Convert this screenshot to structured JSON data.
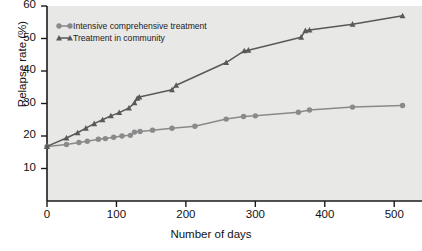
{
  "chart_data": {
    "type": "line",
    "title": "",
    "xlabel": "Number of days",
    "ylabel": "Relapse rate (%)",
    "xlim": [
      0,
      540
    ],
    "ylim": [
      0,
      60
    ],
    "xticks": [
      0,
      100,
      200,
      300,
      400,
      500
    ],
    "yticks": [
      10,
      20,
      30,
      40,
      50,
      60
    ],
    "grid": false,
    "legend_position": "top-left",
    "plot_background": "#e8e8e6",
    "series": [
      {
        "name": "Intensive comprehensive treatment",
        "marker": "circle",
        "color": "#8a8a8a",
        "points": [
          [
            0,
            16.8
          ],
          [
            28,
            17.4
          ],
          [
            46,
            18.0
          ],
          [
            58,
            18.4
          ],
          [
            74,
            19.0
          ],
          [
            84,
            19.2
          ],
          [
            96,
            19.6
          ],
          [
            108,
            20.0
          ],
          [
            120,
            20.2
          ],
          [
            126,
            21.2
          ],
          [
            134,
            21.4
          ],
          [
            152,
            21.8
          ],
          [
            180,
            22.4
          ],
          [
            213,
            23.0
          ],
          [
            258,
            25.2
          ],
          [
            283,
            26.0
          ],
          [
            300,
            26.2
          ],
          [
            362,
            27.3
          ],
          [
            378,
            28.0
          ],
          [
            440,
            28.9
          ],
          [
            512,
            29.4
          ]
        ]
      },
      {
        "name": "Treatment in community",
        "marker": "triangle",
        "color": "#595959",
        "points": [
          [
            0,
            16.8
          ],
          [
            28,
            19.4
          ],
          [
            44,
            21.0
          ],
          [
            56,
            22.4
          ],
          [
            68,
            23.8
          ],
          [
            80,
            25.0
          ],
          [
            92,
            26.2
          ],
          [
            104,
            27.2
          ],
          [
            118,
            28.6
          ],
          [
            126,
            30.2
          ],
          [
            130,
            31.6
          ],
          [
            133,
            32.0
          ],
          [
            180,
            34.2
          ],
          [
            186,
            35.6
          ],
          [
            258,
            42.6
          ],
          [
            284,
            46.2
          ],
          [
            290,
            46.4
          ],
          [
            366,
            50.4
          ],
          [
            372,
            52.4
          ],
          [
            378,
            52.6
          ],
          [
            440,
            54.4
          ],
          [
            512,
            57.0
          ]
        ]
      }
    ]
  },
  "legend": {
    "items": [
      {
        "label": "Intensive comprehensive treatment",
        "marker": "circle",
        "color": "#8a8a8a"
      },
      {
        "label": "Treatment in community",
        "marker": "triangle",
        "color": "#595959"
      }
    ]
  },
  "axes": {
    "y_tick_labels": [
      "60",
      "50",
      "40",
      "30",
      "20",
      "10"
    ],
    "x_tick_labels": [
      "0",
      "100",
      "200",
      "300",
      "400",
      "500"
    ],
    "y_title": "Relapse rate (%)",
    "x_title": "Number of days"
  }
}
